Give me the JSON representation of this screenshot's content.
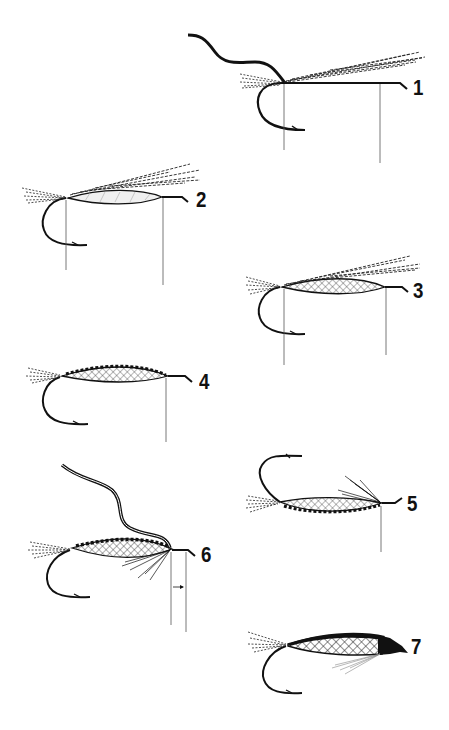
{
  "diagram": {
    "type": "fly-tying-steps",
    "background": "#ffffff",
    "ink_color": "#111111",
    "steps": [
      {
        "number": "1",
        "label": "1",
        "description": "thread and hackle/wing fibers tied at hook bend, bare shank with measurement lines"
      },
      {
        "number": "2",
        "label": "2",
        "description": "tail fibers and wing fibers tied in, smooth underbody formed"
      },
      {
        "number": "3",
        "label": "3",
        "description": "crosshatched (mylar/tinsel) body wrapped over underbody"
      },
      {
        "number": "4",
        "label": "4",
        "description": "body completed with ribbing along top"
      },
      {
        "number": "5",
        "label": "5",
        "description": "fly inverted, throat hackle fibers tied in at head"
      },
      {
        "number": "6",
        "label": "6",
        "description": "thread at head, throat hackle, head length indicated by arrow between lines"
      },
      {
        "number": "7",
        "label": "7",
        "description": "finished fly with black wing and tapered head"
      }
    ]
  }
}
